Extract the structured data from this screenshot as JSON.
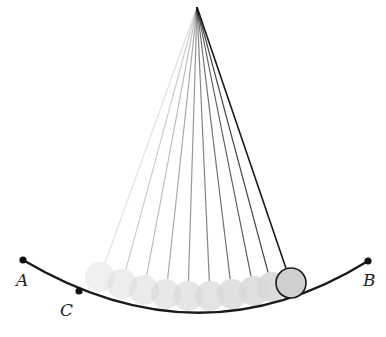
{
  "figure": {
    "width": 386,
    "height": 337,
    "pivot": {
      "x": 197,
      "y": 7
    },
    "track": {
      "color": "#1a1a1a",
      "path": "M 23 260 Q 200 365 368 261"
    },
    "points": [
      {
        "id": "A",
        "label": "A",
        "x": 23,
        "y": 260,
        "label_x": 16,
        "label_y": 286
      },
      {
        "id": "B",
        "label": "B",
        "x": 368,
        "y": 261,
        "label_x": 363,
        "label_y": 286
      },
      {
        "id": "C",
        "label": "C",
        "x": 79,
        "y": 291,
        "label_x": 60,
        "label_y": 316
      }
    ],
    "ghost_balls": [
      {
        "x": 100,
        "y": 277,
        "opacity": 0.06
      },
      {
        "x": 122,
        "y": 284,
        "opacity": 0.12
      },
      {
        "x": 144,
        "y": 290,
        "opacity": 0.18
      },
      {
        "x": 166,
        "y": 294,
        "opacity": 0.24
      },
      {
        "x": 188,
        "y": 296,
        "opacity": 0.3
      },
      {
        "x": 210,
        "y": 296,
        "opacity": 0.36
      },
      {
        "x": 232,
        "y": 294,
        "opacity": 0.42
      },
      {
        "x": 254,
        "y": 291,
        "opacity": 0.48
      },
      {
        "x": 272,
        "y": 287,
        "opacity": 0.55
      }
    ],
    "ghost_fill": "#d8d8d8",
    "ball": {
      "x": 291,
      "y": 283,
      "r": 15,
      "fill": "#cfcfcf",
      "stroke": "#1a1a1a"
    },
    "ball_radius": 15
  }
}
